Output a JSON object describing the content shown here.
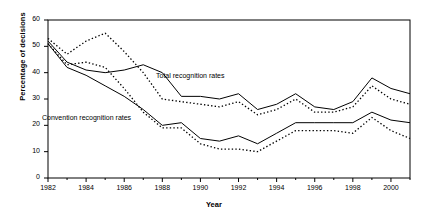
{
  "chart_data": {
    "type": "line",
    "title": "",
    "xlabel": "Year",
    "ylabel": "Percentage of decisions",
    "xlim": [
      1982,
      2001
    ],
    "ylim": [
      0,
      60
    ],
    "yticks": [
      0,
      10,
      20,
      30,
      40,
      50,
      60
    ],
    "xticks": [
      1982,
      1984,
      1986,
      1988,
      1990,
      1992,
      1994,
      1996,
      1998,
      2000
    ],
    "xtick_labels": [
      "1982",
      "1984",
      "1986",
      "1988",
      "1990",
      "1992",
      "1994",
      "1996",
      "1998",
      "2000"
    ],
    "ytick_labels": [
      "0",
      "10",
      "20",
      "30",
      "40",
      "50",
      "60"
    ],
    "grid": false,
    "legend": "annotations",
    "x": [
      1982,
      1983,
      1984,
      1985,
      1986,
      1987,
      1988,
      1989,
      1990,
      1991,
      1992,
      1993,
      1994,
      1995,
      1996,
      1997,
      1998,
      1999,
      2000,
      2001
    ],
    "series": [
      {
        "name": "Total recognition rates (solid upper)",
        "style": "solid",
        "values": [
          52,
          44,
          41,
          40,
          41,
          43,
          40,
          31,
          31,
          30,
          32,
          26,
          28,
          32,
          27,
          26,
          29,
          38,
          34,
          32
        ]
      },
      {
        "name": "Total recognition rates (dotted upper)",
        "style": "dotted",
        "values": [
          53,
          47,
          52,
          55,
          48,
          40,
          30,
          29,
          28,
          27,
          29,
          24,
          26,
          30,
          25,
          25,
          27,
          35,
          30,
          28
        ]
      },
      {
        "name": "Convention recognition rates (solid lower)",
        "style": "solid",
        "values": [
          51,
          42,
          39,
          35,
          31,
          26,
          20,
          21,
          15,
          14,
          16,
          13,
          17,
          21,
          21,
          21,
          21,
          25,
          22,
          21
        ]
      },
      {
        "name": "Convention recognition rates (dotted lower)",
        "style": "dotted",
        "values": [
          51,
          43,
          44,
          42,
          34,
          25,
          19,
          19,
          13,
          11,
          11,
          10,
          14,
          18,
          18,
          18,
          17,
          23,
          18,
          15
        ]
      }
    ],
    "annotations": [
      {
        "text": "Total recognition rates",
        "x_px": 156,
        "y_px": 72
      },
      {
        "text": "Convention recognition rates",
        "x_px": 42,
        "y_px": 114
      }
    ]
  },
  "axes": {
    "x_title": "Year",
    "y_title": "Percentage of decisions"
  }
}
